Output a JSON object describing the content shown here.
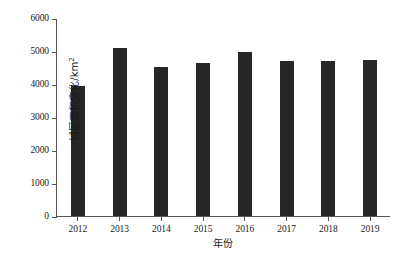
{
  "chart_data": {
    "type": "bar",
    "title": "",
    "subtitle": "",
    "xlabel": "年份",
    "ylabel": "城区面积变化/km²",
    "ylabel_base": "城区面积变化/km",
    "ylabel_sup": "2",
    "categories": [
      "2012",
      "2013",
      "2014",
      "2015",
      "2016",
      "2017",
      "2018",
      "2019"
    ],
    "values": [
      3950,
      5080,
      4520,
      4640,
      4970,
      4710,
      4710,
      4730
    ],
    "ylim": [
      0,
      6000
    ],
    "ytick_values": [
      0,
      1000,
      2000,
      3000,
      4000,
      5000,
      6000
    ],
    "ytick_labels": [
      "0",
      "1000",
      "2000",
      "3000",
      "4000",
      "5000",
      "6000"
    ],
    "grid": false,
    "legend": false,
    "legend_position": "none",
    "bar_color": "#262626",
    "axis_color": "#555555",
    "background_color": "#ffffff"
  }
}
